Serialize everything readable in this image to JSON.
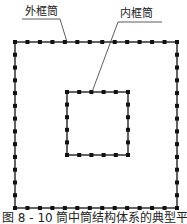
{
  "labels": {
    "outer_tube": "外框筒",
    "inner_tube": "内框筒"
  },
  "caption": "图 8 - 10   筒中筒结构体系的典型平面",
  "geometry": {
    "outer": {
      "x0": 15,
      "y0": 42,
      "x1": 177,
      "y1": 208,
      "cols": 14,
      "rows": 14
    },
    "inner": {
      "x0": 67,
      "y0": 92,
      "x1": 128,
      "y1": 155,
      "cols": 6,
      "rows": 6
    }
  },
  "colors": {
    "line": "#222222",
    "column": "#111111"
  }
}
